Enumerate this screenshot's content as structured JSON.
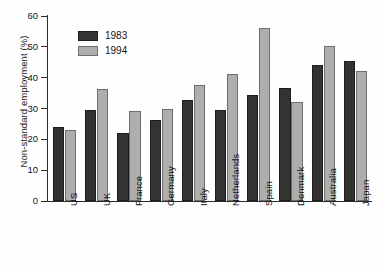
{
  "chart_data": {
    "type": "bar",
    "title": "",
    "xlabel": "",
    "ylabel": "Non-standard employment (%)",
    "ylim": [
      0,
      60
    ],
    "yticks": [
      0,
      10,
      20,
      30,
      40,
      50,
      60
    ],
    "grid": false,
    "legend_position": "upper-left-inside",
    "categories": [
      "US",
      "UK",
      "France",
      "Germany",
      "Italy",
      "Netherlands",
      "Spain",
      "Denmark",
      "Australia",
      "Japan"
    ],
    "series": [
      {
        "name": "1983",
        "color": "#333333",
        "values": [
          24.0,
          29.5,
          22.2,
          26.4,
          32.8,
          29.4,
          34.5,
          36.5,
          44.0,
          45.5
        ]
      },
      {
        "name": "1994",
        "color": "#aeaeae",
        "values": [
          23.1,
          36.2,
          29.3,
          30.0,
          37.5,
          41.3,
          56.2,
          32.2,
          50.4,
          42.3
        ]
      }
    ]
  },
  "axis": {
    "y_title": "Non-standard employment (%)",
    "tick_labels": [
      "0",
      "10",
      "20",
      "30",
      "40",
      "50",
      "60"
    ]
  },
  "legend": {
    "entries": [
      {
        "label": "1983"
      },
      {
        "label": "1994"
      }
    ]
  }
}
